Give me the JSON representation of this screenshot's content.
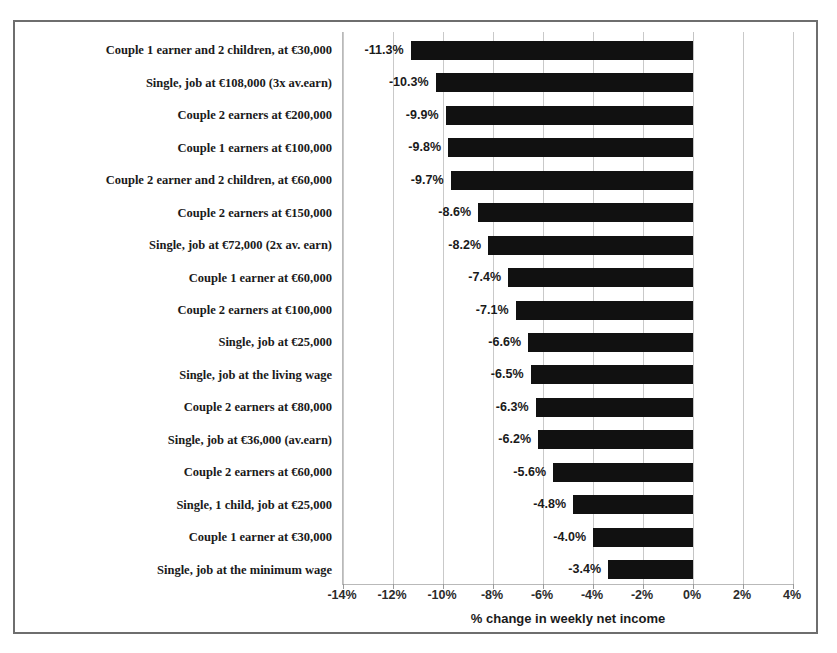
{
  "chart_data": {
    "type": "bar",
    "orientation": "horizontal",
    "title": "",
    "xlabel": "% change in weekly net income",
    "ylabel": "",
    "xlim": [
      -14,
      4
    ],
    "xtick_step": 2,
    "grid": true,
    "legend": false,
    "bar_color": "#111111",
    "categories": [
      "Couple 1 earner and 2 children, at €30,000",
      "Single, job at €108,000 (3x av.earn)",
      "Couple 2 earners at €200,000",
      "Couple 1 earners at €100,000",
      "Couple 2 earner and 2 children, at €60,000",
      "Couple 2 earners at €150,000",
      "Single, job at €72,000 (2x av. earn)",
      "Couple 1 earner at €60,000",
      "Couple 2 earners at €100,000",
      "Single, job at €25,000",
      "Single, job at the living wage",
      "Couple 2 earners at €80,000",
      "Single, job at €36,000 (av.earn)",
      "Couple 2 earners at €60,000",
      "Single, 1 child, job at €25,000",
      "Couple 1 earner at €30,000",
      "Single, job at the minimum wage"
    ],
    "values": [
      -11.3,
      -10.3,
      -9.9,
      -9.8,
      -9.7,
      -8.6,
      -8.2,
      -7.4,
      -7.1,
      -6.6,
      -6.5,
      -6.3,
      -6.2,
      -5.6,
      -4.8,
      -4.0,
      -3.4
    ],
    "value_labels": [
      "-11.3%",
      "-10.3%",
      "-9.9%",
      "-9.8%",
      "-9.7%",
      "-8.6%",
      "-8.2%",
      "-7.4%",
      "-7.1%",
      "-6.6%",
      "-6.5%",
      "-6.3%",
      "-6.2%",
      "-5.6%",
      "-4.8%",
      "-4.0%",
      "-3.4%"
    ],
    "xticks": [
      -14,
      -12,
      -10,
      -8,
      -6,
      -4,
      -2,
      0,
      2,
      4
    ],
    "xtick_labels": [
      "-14%",
      "-12%",
      "-10%",
      "-8%",
      "-6%",
      "-4%",
      "-2%",
      "0%",
      "2%",
      "4%"
    ]
  }
}
